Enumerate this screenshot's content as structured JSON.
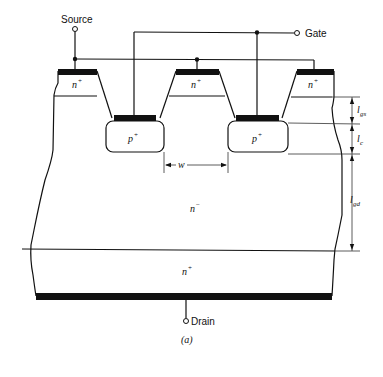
{
  "figure": {
    "caption": "(a)",
    "terminals": {
      "source": "Source",
      "gate": "Gate",
      "drain": "Drain"
    },
    "regions": {
      "n_plus_source_left": {
        "base": "n",
        "sup": "+"
      },
      "n_plus_source_mid": {
        "base": "n",
        "sup": "+"
      },
      "n_plus_source_right": {
        "base": "n",
        "sup": "+"
      },
      "p_plus_gate_left": {
        "base": "p",
        "sup": "+"
      },
      "p_plus_gate_right": {
        "base": "p",
        "sup": "+"
      },
      "n_minus_drift": {
        "base": "n",
        "sup": "−"
      },
      "n_plus_substrate": {
        "base": "n",
        "sup": "+"
      }
    },
    "dimensions": {
      "l_gs": {
        "base": "l",
        "sub": "gs"
      },
      "l_c": {
        "base": "l",
        "sub": "c"
      },
      "l_gd": {
        "base": "l",
        "sub": "gd"
      },
      "w": "w"
    },
    "colors": {
      "ink": "#111111",
      "background": "#ffffff"
    }
  }
}
